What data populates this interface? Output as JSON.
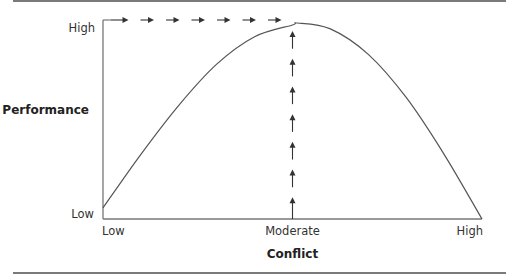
{
  "chart_data": {
    "type": "line",
    "title": "",
    "xlabel": "Conflict",
    "ylabel": "Performance",
    "x_ticks": [
      "Low",
      "Moderate",
      "High"
    ],
    "y_ticks": [
      "Low",
      "High"
    ],
    "xlim": [
      0,
      1
    ],
    "ylim": [
      0,
      1
    ],
    "grid": false,
    "series": [
      {
        "name": "Performance curve",
        "x": [
          0,
          0.1,
          0.2,
          0.3,
          0.4,
          0.5,
          0.513,
          0.6,
          0.7,
          0.8,
          0.9,
          1.0
        ],
        "y": [
          0.057,
          0.33,
          0.58,
          0.79,
          0.93,
          0.99,
          1.0,
          0.97,
          0.84,
          0.62,
          0.33,
          0.0
        ]
      }
    ],
    "annotations": {
      "optimal_point": {
        "x": 0.5,
        "label": "Moderate",
        "y": 1.0
      },
      "horizontal_arrows": {
        "count": 7,
        "direction": "right",
        "y": 1.0
      },
      "vertical_arrows": {
        "count": 7,
        "direction": "up",
        "x": 0.5
      }
    }
  },
  "colors": {
    "line": "#555555",
    "arrow": "#333333",
    "axis": "#777777",
    "rule": "#7a7a7a"
  }
}
